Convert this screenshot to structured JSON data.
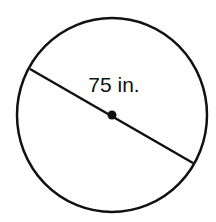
{
  "diagram": {
    "shape": "circle",
    "segment": "diameter",
    "measurement_label": "75 in.",
    "center_point": true,
    "colors": {
      "stroke": "#111111",
      "background": "#ffffff"
    }
  }
}
